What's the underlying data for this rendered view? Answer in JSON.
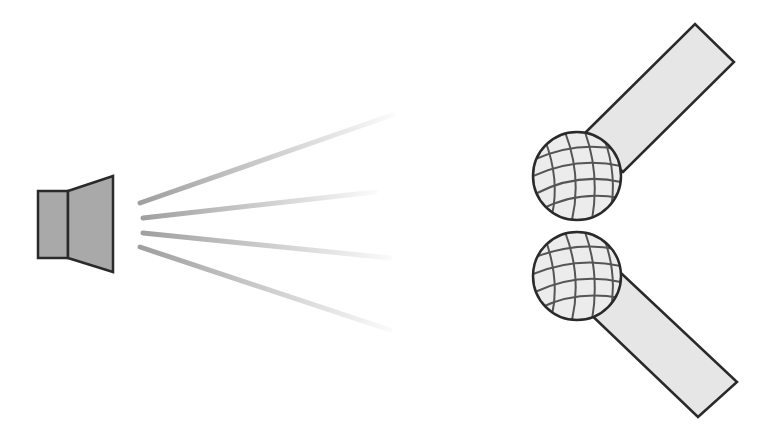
{
  "diagram": {
    "title": "Speaker emitting sound toward two microphones",
    "colors": {
      "background": "#ffffff",
      "outline": "#2a2a2a",
      "speaker_fill": "#a9a9a9",
      "handle_fill": "#e6e6e6",
      "ball_fill": "#ececec",
      "ball_grid": "#555555",
      "wave": "#9a9a9a"
    },
    "nodes": [
      {
        "id": "speaker",
        "label": "speaker"
      },
      {
        "id": "mic-top",
        "label": "microphone (top)"
      },
      {
        "id": "mic-bottom",
        "label": "microphone (bottom)"
      }
    ],
    "edges": [
      {
        "from": "speaker",
        "to": "mic-top",
        "kind": "sound-waves"
      },
      {
        "from": "speaker",
        "to": "mic-bottom",
        "kind": "sound-waves"
      }
    ]
  }
}
